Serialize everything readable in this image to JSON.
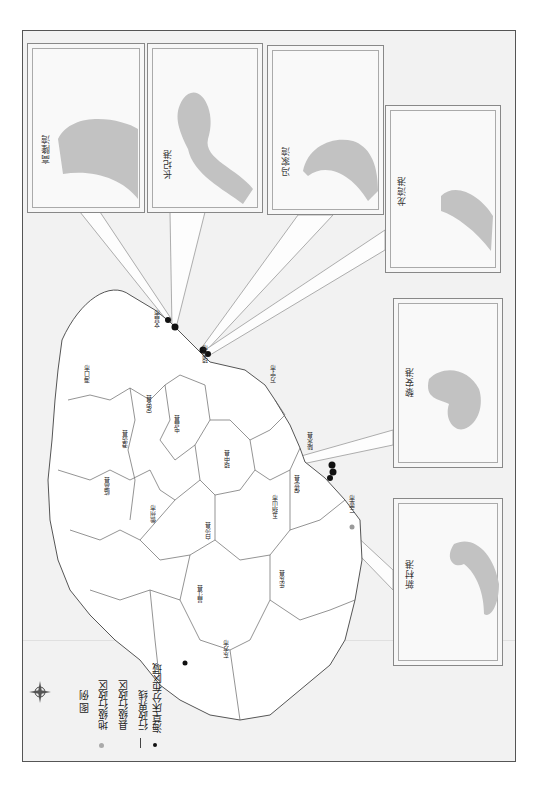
{
  "map": {
    "title": "海南岛海草床分布图",
    "orientation": "rotated-90-ccw",
    "colors": {
      "sea": "#f0f0f0",
      "land": "#ffffff",
      "boundary": "#555555",
      "seagrass_inset": "#bdbdbd",
      "seagrass_marker": "#111111",
      "city_marker": "#9a9a9a"
    }
  },
  "legend": {
    "title": "图 例",
    "items": [
      {
        "symbol": "gray-dot",
        "label": "地级行政区"
      },
      {
        "symbol": "square",
        "label": "县级行政区"
      },
      {
        "symbol": "line",
        "label": "行政界线"
      },
      {
        "symbol": "black-dot",
        "label": "海草床分布区域"
      }
    ]
  },
  "compass": {
    "icon": "compass-rose-icon"
  },
  "counties": [
    {
      "name": "海口市",
      "x": 87,
      "y": 380
    },
    {
      "name": "澄迈县",
      "x": 140,
      "y": 380
    },
    {
      "name": "定安县",
      "x": 148,
      "y": 315
    },
    {
      "name": "文昌市",
      "x": 151,
      "y": 320
    },
    {
      "name": "屯昌县",
      "x": 175,
      "y": 355
    },
    {
      "name": "琼海市",
      "x": 205,
      "y": 310
    },
    {
      "name": "临高县",
      "x": 106,
      "y": 485
    },
    {
      "name": "儋州市",
      "x": 151,
      "y": 510
    },
    {
      "name": "琼中县",
      "x": 225,
      "y": 455
    },
    {
      "name": "万宁市",
      "x": 270,
      "y": 310
    },
    {
      "name": "白沙县",
      "x": 208,
      "y": 535
    },
    {
      "name": "五指山市",
      "x": 275,
      "y": 505
    },
    {
      "name": "保亭县",
      "x": 290,
      "y": 485
    },
    {
      "name": "陵水县",
      "x": 300,
      "y": 432
    },
    {
      "name": "昌江县",
      "x": 198,
      "y": 595
    },
    {
      "name": "乐东县",
      "x": 283,
      "y": 585
    },
    {
      "name": "东方市",
      "x": 225,
      "y": 645
    },
    {
      "name": "三亚市",
      "x": 355,
      "y": 515
    }
  ],
  "insets": [
    {
      "name": "高隆湾",
      "x": 27,
      "y": 43,
      "w": 118,
      "h": 170
    },
    {
      "name": "长圮港",
      "x": 147,
      "y": 43,
      "w": 116,
      "h": 170
    },
    {
      "name": "冯家湾",
      "x": 267,
      "y": 45,
      "w": 117,
      "h": 170
    },
    {
      "name": "龙湾港",
      "x": 385,
      "y": 105,
      "w": 116,
      "h": 168
    },
    {
      "name": "黎安港",
      "x": 393,
      "y": 298,
      "w": 110,
      "h": 170
    },
    {
      "name": "新村港",
      "x": 393,
      "y": 498,
      "w": 110,
      "h": 168
    }
  ]
}
